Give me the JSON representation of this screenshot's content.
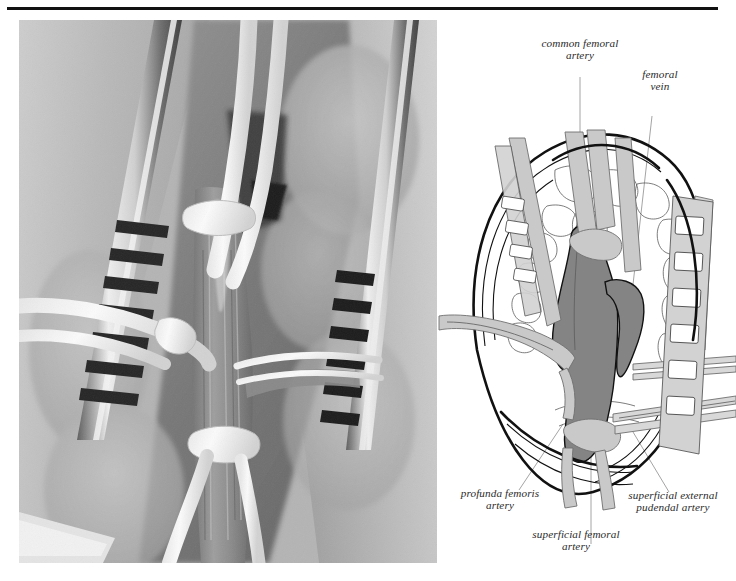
{
  "figure": {
    "type": "surgical-figure",
    "panels": [
      {
        "id": "photo",
        "kind": "operative-photograph",
        "description": "Intraoperative photograph of a groin exposure showing the common femoral artery controlled with vessel loops, held open by self-retaining toothed retractor blades."
      },
      {
        "id": "diagram",
        "kind": "labeled-line-drawing",
        "description": "Schematic line drawing of the same groin exposure with the femoral artery shaded and four structures labeled."
      }
    ]
  },
  "labels": {
    "common_femoral_artery": "common femoral\nartery",
    "femoral_vein": "femoral\nvein",
    "profunda_femoris_artery": "profunda femoris\nartery",
    "superficial_femoral_artery": "superficial femoral\nartery",
    "superficial_external_pudendal_artery": "superficial external\npudendal artery"
  },
  "colors": {
    "rule": "#111111",
    "artery_fill": "#848484",
    "loop_fill": "#c9c9c9",
    "retractor_fill": "#d2d2d2",
    "outline": "#111111",
    "leader_line": "#9a9a9a",
    "label_text": "#2b2b2b",
    "page_background": "#ffffff"
  }
}
